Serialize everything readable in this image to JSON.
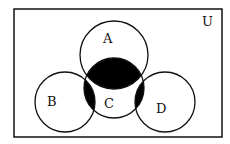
{
  "diagram": {
    "type": "venn",
    "universe_label": "U",
    "sets": [
      {
        "name": "A",
        "label": "A",
        "cx": 114,
        "cy": 55,
        "r": 34
      },
      {
        "name": "B",
        "label": "B",
        "cx": 65,
        "cy": 102,
        "r": 30
      },
      {
        "name": "C",
        "label": "C",
        "cx": 114,
        "cy": 88,
        "r": 30
      },
      {
        "name": "D",
        "label": "D",
        "cx": 165,
        "cy": 102,
        "r": 30
      }
    ],
    "shaded_regions": [
      "A∩C",
      "B∩C",
      "C∩D"
    ],
    "colors": {
      "stroke": "#111111",
      "shade": "#000000",
      "background": "#ffffff"
    }
  }
}
